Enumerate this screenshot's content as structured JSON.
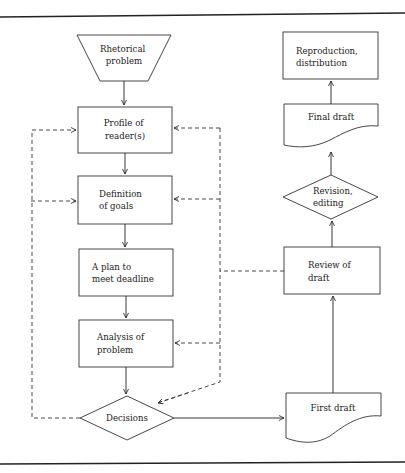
{
  "diagram": {
    "type": "flowchart",
    "nodes": {
      "rhetorical_problem": {
        "shape": "trapezoid",
        "lines": [
          "Rhetorical",
          "problem"
        ]
      },
      "profile_readers": {
        "shape": "rectangle",
        "lines": [
          "Profile of",
          "reader(s)"
        ]
      },
      "definition_goals": {
        "shape": "rectangle",
        "lines": [
          "Definition",
          "of goals"
        ]
      },
      "plan_deadline": {
        "shape": "rectangle",
        "lines": [
          "A plan to",
          "meet deadline"
        ]
      },
      "analysis_problem": {
        "shape": "rectangle",
        "lines": [
          "Analysis of",
          "problem"
        ]
      },
      "decisions": {
        "shape": "diamond",
        "lines": [
          "Decisions"
        ]
      },
      "first_draft": {
        "shape": "document",
        "lines": [
          "First draft"
        ]
      },
      "review_draft": {
        "shape": "rectangle",
        "lines": [
          "Review of",
          "draft"
        ]
      },
      "revision_editing": {
        "shape": "diamond",
        "lines": [
          "Revision,",
          "editing"
        ]
      },
      "final_draft": {
        "shape": "document",
        "lines": [
          "Final draft"
        ]
      },
      "reproduction": {
        "shape": "rectangle",
        "lines": [
          "Reproduction,",
          "distribution"
        ]
      }
    },
    "edges": [
      {
        "from": "rhetorical_problem",
        "to": "profile_readers",
        "style": "solid"
      },
      {
        "from": "profile_readers",
        "to": "definition_goals",
        "style": "solid"
      },
      {
        "from": "definition_goals",
        "to": "plan_deadline",
        "style": "solid"
      },
      {
        "from": "plan_deadline",
        "to": "analysis_problem",
        "style": "solid"
      },
      {
        "from": "analysis_problem",
        "to": "decisions",
        "style": "solid"
      },
      {
        "from": "decisions",
        "to": "first_draft",
        "style": "solid"
      },
      {
        "from": "first_draft",
        "to": "review_draft",
        "style": "solid"
      },
      {
        "from": "review_draft",
        "to": "revision_editing",
        "style": "solid"
      },
      {
        "from": "revision_editing",
        "to": "final_draft",
        "style": "solid"
      },
      {
        "from": "final_draft",
        "to": "reproduction",
        "style": "solid"
      },
      {
        "from": "decisions",
        "to": "profile_readers",
        "style": "dashed",
        "via": "left feedback line"
      },
      {
        "from": "decisions",
        "to": "definition_goals",
        "style": "dashed",
        "via": "left feedback line"
      },
      {
        "from": "review_draft",
        "to": "profile_readers",
        "style": "dashed",
        "via": "right feedback line"
      },
      {
        "from": "review_draft",
        "to": "definition_goals",
        "style": "dashed",
        "via": "right feedback line"
      },
      {
        "from": "review_draft",
        "to": "analysis_problem",
        "style": "dashed",
        "via": "right feedback line"
      },
      {
        "from": "review_draft",
        "to": "decisions",
        "style": "dashed",
        "via": "right feedback line"
      }
    ],
    "colors": {
      "line": "#222222",
      "background": "#ffffff"
    }
  }
}
